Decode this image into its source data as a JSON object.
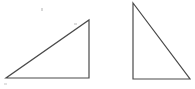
{
  "figure": {
    "canvas": {
      "width": 195,
      "height": 89,
      "background_color": "#ffffff"
    },
    "stroke": {
      "color": "#4a4a4a",
      "width": 1.2
    },
    "shapes": [
      {
        "name": "left-triangle",
        "description": "Right triangle with the right angle at the bottom-right corner; hypotenuse rises from lower-left to upper-right.",
        "right_angle_vertex": "bottom-right",
        "points": "6,78 89,78 89,20",
        "vertices": [
          {
            "label": "bottom-left",
            "x": 6,
            "y": 78
          },
          {
            "label": "bottom-right",
            "x": 89,
            "y": 78
          },
          {
            "label": "top-right",
            "x": 89,
            "y": 20
          }
        ],
        "base_length": 83,
        "height_length": 58
      },
      {
        "name": "right-triangle",
        "description": "Right triangle with the right angle at the bottom-left corner; hypotenuse falls from upper-left to lower-right.",
        "right_angle_vertex": "bottom-left",
        "points": "133,3 133,79 190,79",
        "vertices": [
          {
            "label": "top-left",
            "x": 133,
            "y": 3
          },
          {
            "label": "bottom-left",
            "x": 133,
            "y": 79
          },
          {
            "label": "bottom-right",
            "x": 190,
            "y": 79
          }
        ],
        "base_length": 57,
        "height_length": 76
      }
    ],
    "artifacts": [
      {
        "name": "scan-speck-upper-left",
        "x": 41,
        "y": 8,
        "width": 2,
        "height": 3,
        "color": "#d8d8d8"
      },
      {
        "name": "scan-speck-upper-mid",
        "x": 74,
        "y": 23,
        "width": 3,
        "height": 2,
        "color": "#dcdcdc"
      },
      {
        "name": "scan-speck-lower-left",
        "x": 4,
        "y": 83,
        "width": 3,
        "height": 2,
        "color": "#e2e2e2"
      }
    ]
  }
}
